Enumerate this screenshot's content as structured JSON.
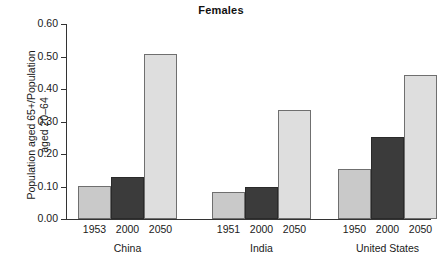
{
  "chart_data": {
    "type": "bar",
    "title": "Females",
    "xlabel": "",
    "ylabel": "Population aged 65+/Population\naged 20–64",
    "ylim": [
      0.0,
      0.6
    ],
    "ytick_labels": [
      "0.60",
      "0.50",
      "0.40",
      "0.30",
      "0.20",
      "0.10",
      "0.00"
    ],
    "ytick_values": [
      0.6,
      0.5,
      0.4,
      0.3,
      0.2,
      0.1,
      0.0
    ],
    "grid": false,
    "legend": "none",
    "groups": [
      {
        "name": "China",
        "bars": [
          {
            "label": "1953",
            "value": 0.103,
            "style": "s0"
          },
          {
            "label": "2000",
            "value": 0.128,
            "style": "s1"
          },
          {
            "label": "2050",
            "value": 0.508,
            "style": "s2"
          }
        ]
      },
      {
        "name": "India",
        "bars": [
          {
            "label": "1951",
            "value": 0.083,
            "style": "s0"
          },
          {
            "label": "2000",
            "value": 0.098,
            "style": "s1"
          },
          {
            "label": "2050",
            "value": 0.334,
            "style": "s2"
          }
        ]
      },
      {
        "name": "United States",
        "bars": [
          {
            "label": "1950",
            "value": 0.155,
            "style": "s0"
          },
          {
            "label": "2000",
            "value": 0.253,
            "style": "s1"
          },
          {
            "label": "2050",
            "value": 0.443,
            "style": "s2"
          }
        ]
      }
    ],
    "colors": {
      "series_early": "#c9c9c9",
      "series_2000": "#3b3b3b",
      "series_2050": "#dedede",
      "axis": "#333333",
      "text": "#1a1a1a"
    }
  }
}
